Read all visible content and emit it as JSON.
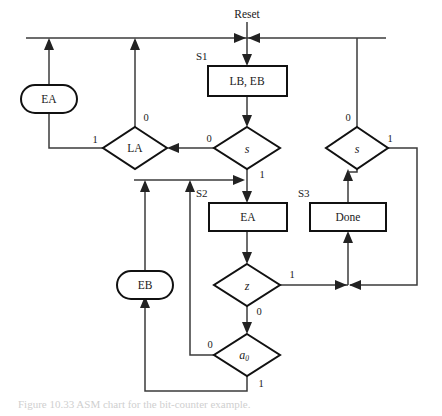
{
  "figure": {
    "title": "ASM chart",
    "caption": "Figure 10.33  ASM chart for the bit-counter example."
  },
  "diagram": {
    "type": "asm-chart",
    "entry_label": "Reset",
    "state_boxes": [
      {
        "id": "S1",
        "state_name": "S1",
        "outputs": "LB, EB",
        "x": 208,
        "y": 66,
        "w": 79,
        "h": 30
      },
      {
        "id": "S2",
        "state_name": "S2",
        "outputs": "EA",
        "x": 209,
        "y": 203,
        "w": 78,
        "h": 28
      },
      {
        "id": "S3",
        "state_name": "S3",
        "outputs": "Done",
        "x": 310,
        "y": 203,
        "w": 76,
        "h": 28
      }
    ],
    "conditional_outputs": [
      {
        "id": "EA_cond",
        "label": "EA",
        "cx": 49,
        "cy": 99,
        "rw": 28,
        "rh": 14
      },
      {
        "id": "EB_cond",
        "label": "EB",
        "cx": 145,
        "cy": 285,
        "rw": 28,
        "rh": 14
      }
    ],
    "decisions": [
      {
        "id": "LA",
        "label": "LA",
        "italic": false,
        "cx": 135,
        "cy": 148,
        "rw": 32,
        "rh": 21,
        "branches": [
          {
            "value": "0",
            "dir": "up"
          },
          {
            "value": "1",
            "dir": "left"
          }
        ]
      },
      {
        "id": "s_left",
        "label": "s",
        "italic": true,
        "cx": 247,
        "cy": 148,
        "rw": 33,
        "rh": 21,
        "branches": [
          {
            "value": "0",
            "dir": "left"
          },
          {
            "value": "1",
            "dir": "down"
          }
        ]
      },
      {
        "id": "s_right",
        "label": "s",
        "italic": true,
        "cx": 357,
        "cy": 148,
        "rw": 31,
        "rh": 21,
        "branches": [
          {
            "value": "0",
            "dir": "up"
          },
          {
            "value": "1",
            "dir": "right"
          }
        ]
      },
      {
        "id": "z",
        "label": "z",
        "italic": true,
        "cx": 247,
        "cy": 285,
        "rw": 33,
        "rh": 21,
        "branches": [
          {
            "value": "1",
            "dir": "right"
          },
          {
            "value": "0",
            "dir": "down"
          }
        ]
      },
      {
        "id": "a0",
        "label": "a",
        "sub": "0",
        "italic": true,
        "cx": 247,
        "cy": 355,
        "rw": 33,
        "rh": 21,
        "branches": [
          {
            "value": "0",
            "dir": "left"
          },
          {
            "value": "1",
            "dir": "down"
          }
        ]
      }
    ],
    "edge_labels": [
      {
        "text": "0",
        "x": 146,
        "y": 119
      },
      {
        "text": "1",
        "x": 95,
        "y": 141
      },
      {
        "text": "0",
        "x": 209,
        "y": 140
      },
      {
        "text": "1",
        "x": 262,
        "y": 176
      },
      {
        "text": "0",
        "x": 348,
        "y": 119
      },
      {
        "text": "1",
        "x": 390,
        "y": 140
      },
      {
        "text": "1",
        "x": 292,
        "y": 276
      },
      {
        "text": "0",
        "x": 259,
        "y": 313
      },
      {
        "text": "0",
        "x": 210,
        "y": 346
      },
      {
        "text": "1",
        "x": 261,
        "y": 385
      }
    ],
    "state_name_labels": [
      {
        "text": "S1",
        "x": 196,
        "y": 57
      },
      {
        "text": "S2",
        "x": 196,
        "y": 194
      },
      {
        "text": "S3",
        "x": 298,
        "y": 194
      }
    ],
    "reset_label": {
      "text": "Reset",
      "x": 247,
      "y": 15
    }
  },
  "colors": {
    "wire": "#3b3b3b",
    "outline": "#111111",
    "text": "#1a1a1a",
    "background": "#ffffff"
  }
}
